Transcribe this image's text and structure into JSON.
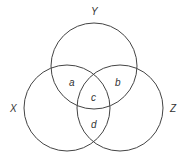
{
  "diagram": {
    "type": "venn",
    "sets": [
      {
        "label": "Y",
        "cx": 94,
        "cy": 66,
        "r": 43
      },
      {
        "label": "X",
        "cx": 67,
        "cy": 108,
        "r": 43
      },
      {
        "label": "Z",
        "cx": 120,
        "cy": 108,
        "r": 43
      }
    ],
    "set_labels": {
      "x": "X",
      "y": "Y",
      "z": "Z"
    },
    "regions": {
      "a": "a",
      "b": "b",
      "c": "c",
      "d": "d"
    },
    "colors": {
      "stroke": "#444444",
      "background": "#ffffff"
    }
  }
}
